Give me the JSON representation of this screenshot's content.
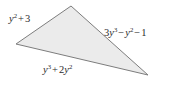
{
  "figure": {
    "type": "triangle-diagram",
    "background_color": "#ffffff",
    "fill_color": "#ebebeb",
    "stroke_color": "#7d7d7d",
    "vertices": {
      "apex": [
        71,
        6
      ],
      "left": [
        16,
        44
      ],
      "right": [
        148,
        75
      ]
    },
    "labels": {
      "left_side": {
        "full_text": "y² + 3",
        "base1": "y",
        "exp1": "2",
        "op1": "+",
        "term2": "3"
      },
      "right_side": {
        "full_text": "3y³ − y² − 1",
        "coeff1": "3",
        "base1": "y",
        "exp1": "3",
        "op1": "−",
        "base2": "y",
        "exp2": "2",
        "op2": "−",
        "term3": "1"
      },
      "bottom_side": {
        "full_text": "y³ + 2y²",
        "base1": "y",
        "exp1": "3",
        "op1": "+",
        "coeff2": "2",
        "base2": "y",
        "exp2": "2"
      }
    }
  }
}
